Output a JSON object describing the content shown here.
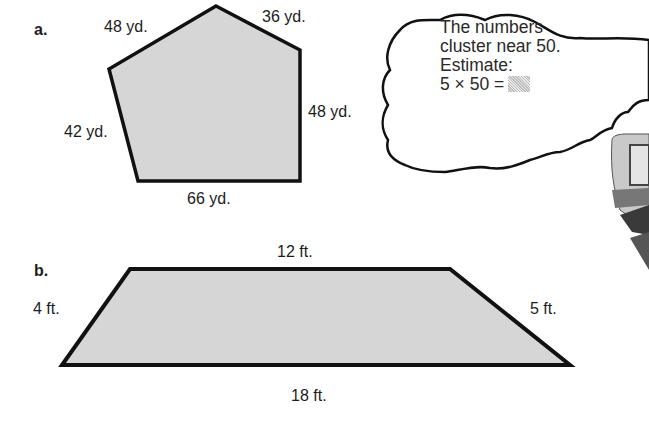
{
  "problems": [
    {
      "label": "a.",
      "shape": "pentagon",
      "sides": [
        {
          "name": "top-left",
          "length": "48 yd."
        },
        {
          "name": "top-right",
          "length": "36 yd."
        },
        {
          "name": "right",
          "length": "48 yd."
        },
        {
          "name": "bottom",
          "length": "66 yd."
        },
        {
          "name": "left",
          "length": "42 yd."
        }
      ],
      "fill_color": "#d6d6d6",
      "stroke_color": "#111111"
    },
    {
      "label": "b.",
      "shape": "trapezoid",
      "sides": [
        {
          "name": "top",
          "length": "12 ft."
        },
        {
          "name": "right",
          "length": "5 ft."
        },
        {
          "name": "bottom",
          "length": "18 ft."
        },
        {
          "name": "left",
          "length": "4 ft."
        }
      ],
      "fill_color": "#d6d6d6",
      "stroke_color": "#111111"
    }
  ],
  "thought_bubble": {
    "lines": [
      "The numbers",
      "cluster near 50.",
      "Estimate:",
      "5 × 50 ="
    ],
    "answer_placeholder": "shaded-box"
  }
}
